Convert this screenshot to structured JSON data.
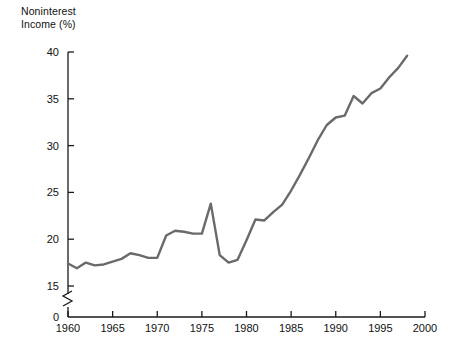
{
  "chart_data": {
    "type": "line",
    "title": "",
    "ylabel": "Noninterest\nIncome (%)",
    "xlabel": "",
    "ylim": [
      15,
      40
    ],
    "xlim": [
      1960,
      2000
    ],
    "y_axis_break": true,
    "y_axis_zero_label": "0",
    "grid": false,
    "legend": null,
    "yticks": [
      15,
      20,
      25,
      30,
      35,
      40
    ],
    "ytick_labels": [
      "15",
      "20",
      "25",
      "30",
      "35",
      "40"
    ],
    "xticks": [
      1960,
      1965,
      1970,
      1975,
      1980,
      1985,
      1990,
      1995,
      2000
    ],
    "xtick_labels": [
      "1960",
      "1965",
      "1970",
      "1975",
      "1980",
      "1985",
      "1990",
      "1995",
      "2000"
    ],
    "series": [
      {
        "name": "Noninterest Income",
        "color": "#6a6a6a",
        "x": [
          1960,
          1961,
          1962,
          1963,
          1964,
          1965,
          1966,
          1967,
          1968,
          1969,
          1970,
          1971,
          1972,
          1973,
          1974,
          1975,
          1976,
          1977,
          1978,
          1979,
          1980,
          1981,
          1982,
          1983,
          1984,
          1985,
          1986,
          1987,
          1988,
          1989,
          1990,
          1991,
          1992,
          1993,
          1994,
          1995,
          1996,
          1997,
          1998
        ],
        "values": [
          17.4,
          16.9,
          17.5,
          17.2,
          17.3,
          17.6,
          17.9,
          18.5,
          18.3,
          18.0,
          18.0,
          20.4,
          20.9,
          20.8,
          20.6,
          20.6,
          23.8,
          18.3,
          17.5,
          17.8,
          19.9,
          22.1,
          22.0,
          22.9,
          23.7,
          25.2,
          26.9,
          28.7,
          30.6,
          32.2,
          33.0,
          33.2,
          35.3,
          34.5,
          35.6,
          36.1,
          37.3,
          38.3,
          39.6
        ]
      }
    ]
  },
  "axis": {
    "title_text": "Noninterest\nIncome (%)",
    "zero_label": "0"
  }
}
